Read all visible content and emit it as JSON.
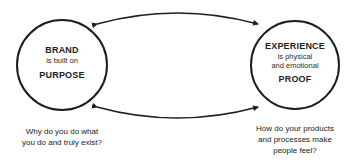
{
  "diagram": {
    "nodes": [
      {
        "id": "brand",
        "title": "BRAND",
        "subtitle": "is built on",
        "footer": "PURPOSE",
        "caption": [
          "Why do you do what",
          "you do and truly exist?"
        ]
      },
      {
        "id": "experience",
        "title": "EXPERIENCE",
        "subtitle": [
          "is physical",
          "and emotional"
        ],
        "footer": "PROOF",
        "caption": [
          "How do your products",
          "and processes make",
          "people feel?"
        ]
      }
    ],
    "edges": [
      {
        "from": "experience",
        "to": "brand",
        "type": "arrow-both",
        "position": "top"
      },
      {
        "from": "brand",
        "to": "experience",
        "type": "arrow-both",
        "position": "bottom"
      }
    ],
    "colors": {
      "stroke": "#1e1e1e",
      "background": "#ffffff"
    }
  }
}
